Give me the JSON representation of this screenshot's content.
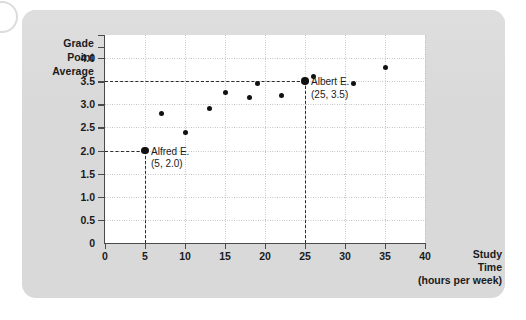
{
  "figure": {
    "decor": {
      "circle_icon": "circle-outline-icon"
    },
    "panel_color": "#d9d9d9"
  },
  "chart_data": {
    "type": "scatter",
    "title": "",
    "ylabel_lines": [
      "Grade",
      "Point",
      "Average"
    ],
    "xlabel_lines": [
      "Study",
      "Time",
      "(hours per week)"
    ],
    "xlabel": "Study Time (hours per week)",
    "ylabel": "Grade Point Average",
    "xlim": [
      0,
      40
    ],
    "ylim": [
      0,
      4.5
    ],
    "xticks": [
      0,
      5,
      10,
      15,
      20,
      25,
      30,
      35,
      40
    ],
    "xtick_labels": [
      "0",
      "5",
      "10",
      "15",
      "20",
      "25",
      "30",
      "35",
      "40"
    ],
    "yticks": [
      0.5,
      1.0,
      1.5,
      2.0,
      2.5,
      3.0,
      3.5,
      4.0
    ],
    "ytick_labels": [
      "0.5",
      "1.0",
      "1.5",
      "2.0",
      "2.5",
      "3.0",
      "3.5",
      "4.0"
    ],
    "grid": true,
    "legend": "none",
    "point_color": "#111111",
    "points": [
      {
        "x": 5,
        "y": 2.0,
        "highlight": true
      },
      {
        "x": 7,
        "y": 2.8,
        "highlight": false
      },
      {
        "x": 10,
        "y": 2.4,
        "highlight": false
      },
      {
        "x": 13,
        "y": 2.9,
        "highlight": false
      },
      {
        "x": 15,
        "y": 3.25,
        "highlight": false
      },
      {
        "x": 18,
        "y": 3.15,
        "highlight": false
      },
      {
        "x": 19,
        "y": 3.45,
        "highlight": false
      },
      {
        "x": 22,
        "y": 3.2,
        "highlight": false
      },
      {
        "x": 25,
        "y": 3.5,
        "highlight": true
      },
      {
        "x": 26,
        "y": 3.6,
        "highlight": false
      },
      {
        "x": 31,
        "y": 3.45,
        "highlight": false
      },
      {
        "x": 35,
        "y": 3.8,
        "highlight": false
      }
    ],
    "annotations": [
      {
        "name": "Alfred E.",
        "coords": "(5, 2.0)",
        "x": 5,
        "y": 2.0
      },
      {
        "name": "Albert E.",
        "coords": "(25, 3.5)",
        "x": 25,
        "y": 3.5
      }
    ],
    "guides": [
      {
        "type": "horizontal",
        "value": 3.5,
        "from_x": 0,
        "to_x": 25
      },
      {
        "type": "vertical",
        "value": 25,
        "from_y": 0,
        "to_y": 3.5
      },
      {
        "type": "horizontal",
        "value": 2.0,
        "from_x": 0,
        "to_x": 5
      },
      {
        "type": "vertical",
        "value": 5,
        "from_y": 0,
        "to_y": 2.0
      }
    ]
  }
}
